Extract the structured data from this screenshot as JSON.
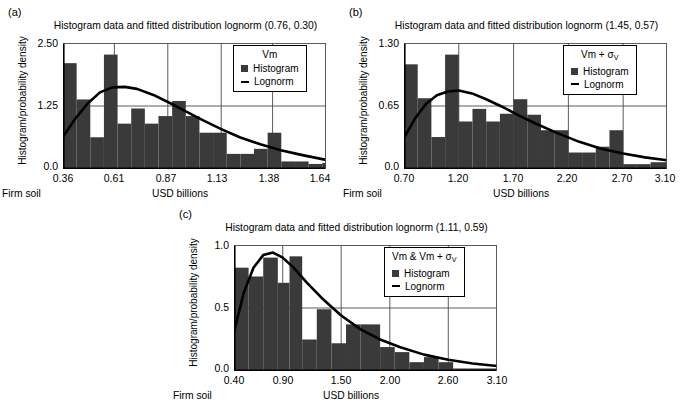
{
  "figure": {
    "panels": [
      "a",
      "b",
      "c"
    ],
    "axis_label_x": "USD billions",
    "axis_label_y": "Histogram/probability density",
    "foot_left": "Firm soil"
  },
  "legend_common": {
    "histogram_label": "Histogram",
    "lognorm_label": "Lognorm",
    "histogram_color": "#3a3a3a",
    "lognorm_color": "#000000"
  },
  "panel_a": {
    "label": "(a)",
    "title": "Histogram data and fitted distribution lognorm (0.76, 0.30)",
    "legend_title": "Vm",
    "foot_left": "Firm soil",
    "xlabel": "USD billions",
    "ylabel": "Histogram/probability density",
    "yticks": [
      "0.0",
      "1.25",
      "2.50"
    ],
    "xticks": [
      "0.36",
      "0.61",
      "0.87",
      "1.13",
      "1.38",
      "1.64"
    ]
  },
  "panel_b": {
    "label": "(b)",
    "title": "Histogram data and fitted distribution lognorm (1.45, 0.57)",
    "legend_title_main": "Vm + σ",
    "legend_title_sub": "V",
    "foot_left": "Firm soil",
    "xlabel": "USD billions",
    "ylabel": "Histogram/probability density",
    "yticks": [
      "0.0",
      "0.65",
      "1.30"
    ],
    "xticks": [
      "0.70",
      "1.20",
      "1.70",
      "2.20",
      "2.70",
      "3.10"
    ]
  },
  "panel_c": {
    "label": "(c)",
    "title": "Histogram data and fitted distribution lognorm (1.11, 0.59)",
    "legend_title_main": "Vm & Vm + σ",
    "legend_title_sub": "V",
    "foot_left": "Firm soil",
    "xlabel": "USD billions",
    "ylabel": "Histogram/probability density",
    "yticks": [
      "0.0",
      "0.5",
      "1.0"
    ],
    "xticks": [
      "0.40",
      "0.90",
      "1.50",
      "2.00",
      "2.60",
      "3.10"
    ]
  },
  "chart_data": [
    {
      "type": "bar",
      "panel": "a",
      "title": "Histogram data and fitted distribution lognorm (0.76, 0.30)",
      "xlabel": "USD billions",
      "ylabel": "Histogram/probability density",
      "xlim": [
        0.36,
        1.64
      ],
      "ylim": [
        0.0,
        2.5
      ],
      "ytick_values": [
        0.0,
        1.25,
        2.5
      ],
      "xtick_values": [
        0.36,
        0.61,
        0.87,
        1.13,
        1.38,
        1.64
      ],
      "grid": true,
      "legend_position": "top-right",
      "legend_entries": [
        "Histogram",
        "Lognorm"
      ],
      "series": [
        {
          "name": "Histogram",
          "bin_edges": [
            0.36,
            0.4264,
            0.4928,
            0.5592,
            0.6256,
            0.692,
            0.7584,
            0.8248,
            0.8912,
            0.9576,
            1.024,
            1.0904,
            1.1568,
            1.2232,
            1.2896,
            1.356,
            1.4224,
            1.4888,
            1.5552,
            1.6216,
            1.64
          ],
          "values": [
            2.1,
            1.38,
            0.63,
            2.27,
            0.9,
            1.2,
            0.9,
            1.05,
            1.35,
            1.05,
            0.72,
            0.72,
            0.3,
            0.3,
            0.4,
            0.72,
            0.15,
            0.15,
            0.1,
            0.12
          ]
        },
        {
          "name": "Lognorm",
          "type": "line",
          "x": [
            0.36,
            0.42,
            0.48,
            0.54,
            0.6,
            0.66,
            0.72,
            0.8,
            0.88,
            0.96,
            1.04,
            1.13,
            1.22,
            1.32,
            1.42,
            1.52,
            1.64
          ],
          "y": [
            0.64,
            1.0,
            1.3,
            1.52,
            1.62,
            1.63,
            1.59,
            1.47,
            1.31,
            1.14,
            0.97,
            0.79,
            0.63,
            0.49,
            0.37,
            0.28,
            0.18
          ]
        }
      ]
    },
    {
      "type": "bar",
      "panel": "b",
      "title": "Histogram data and fitted distribution lognorm (1.45, 0.57)",
      "xlabel": "USD billions",
      "ylabel": "Histogram/probability density",
      "xlim": [
        0.7,
        3.1
      ],
      "ylim": [
        0.0,
        1.3
      ],
      "ytick_values": [
        0.0,
        0.65,
        1.3
      ],
      "xtick_values": [
        0.7,
        1.2,
        1.7,
        2.2,
        2.7,
        3.1
      ],
      "grid": true,
      "legend_position": "top-right",
      "legend_entries": [
        "Histogram",
        "Lognorm"
      ],
      "series": [
        {
          "name": "Histogram",
          "bin_edges": [
            0.7,
            0.825,
            0.95,
            1.075,
            1.2,
            1.325,
            1.45,
            1.575,
            1.7,
            1.825,
            1.95,
            2.075,
            2.2,
            2.325,
            2.45,
            2.575,
            2.7,
            2.825,
            2.95,
            3.1
          ],
          "values": [
            1.08,
            0.73,
            0.33,
            1.18,
            0.49,
            0.62,
            0.49,
            0.57,
            0.72,
            0.56,
            0.4,
            0.4,
            0.17,
            0.17,
            0.23,
            0.4,
            0.05,
            0.05,
            0.07
          ]
        },
        {
          "name": "Lognorm",
          "type": "line",
          "x": [
            0.7,
            0.8,
            0.9,
            1.0,
            1.1,
            1.2,
            1.32,
            1.45,
            1.6,
            1.75,
            1.9,
            2.1,
            2.3,
            2.5,
            2.7,
            2.9,
            3.1
          ],
          "y": [
            0.32,
            0.52,
            0.67,
            0.76,
            0.8,
            0.81,
            0.78,
            0.72,
            0.64,
            0.55,
            0.47,
            0.37,
            0.28,
            0.21,
            0.16,
            0.12,
            0.09
          ]
        }
      ]
    },
    {
      "type": "bar",
      "panel": "c",
      "title": "Histogram data and fitted distribution lognorm (1.11, 0.59)",
      "xlabel": "USD billions",
      "ylabel": "Histogram/probability density",
      "xlim": [
        0.4,
        3.1
      ],
      "ylim": [
        0.0,
        1.0
      ],
      "ytick_values": [
        0.0,
        0.5,
        1.0
      ],
      "xtick_values": [
        0.4,
        0.9,
        1.5,
        2.0,
        2.6,
        3.1
      ],
      "grid": true,
      "legend_position": "top-right",
      "legend_entries": [
        "Histogram",
        "Lognorm"
      ],
      "series": [
        {
          "name": "Histogram",
          "bin_edges": [
            0.4,
            0.55,
            0.7,
            0.85,
            0.97,
            1.1,
            1.25,
            1.4,
            1.55,
            1.7,
            1.9,
            2.05,
            2.2,
            2.35,
            2.5,
            2.65,
            2.8,
            3.1
          ],
          "values": [
            0.82,
            0.75,
            0.9,
            0.7,
            0.91,
            0.25,
            0.49,
            0.22,
            0.37,
            0.37,
            0.19,
            0.15,
            0.07,
            0.11,
            0.07,
            0.02,
            0.02
          ]
        },
        {
          "name": "Lognorm",
          "type": "line",
          "x": [
            0.4,
            0.5,
            0.6,
            0.7,
            0.8,
            0.9,
            1.0,
            1.15,
            1.3,
            1.5,
            1.7,
            1.9,
            2.1,
            2.35,
            2.6,
            2.85,
            3.1
          ],
          "y": [
            0.31,
            0.62,
            0.82,
            0.92,
            0.94,
            0.9,
            0.83,
            0.7,
            0.58,
            0.44,
            0.33,
            0.25,
            0.19,
            0.13,
            0.09,
            0.06,
            0.04
          ]
        }
      ]
    }
  ]
}
